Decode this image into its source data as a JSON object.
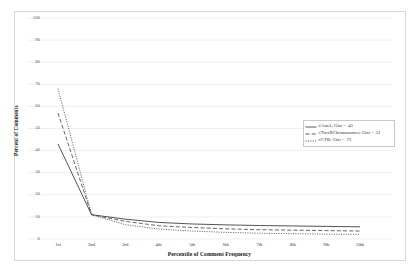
{
  "chart_data": {
    "type": "line",
    "title": "",
    "xlabel": "Percentile of Comment Frequency",
    "ylabel": "Percent of Comments",
    "categories": [
      "1st",
      "2nd",
      "3rd",
      "4th",
      "5th",
      "6th",
      "7th",
      "8th",
      "9th",
      "10th"
    ],
    "ylim": [
      0,
      100
    ],
    "yticks": [
      0,
      10,
      20,
      30,
      40,
      50,
      60,
      70,
      80,
      90,
      100
    ],
    "grid": true,
    "legend_position": "center-right",
    "series": [
      {
        "name": "r/AmA; Gini = .43",
        "label": "r/AmA; Gini = .43",
        "style": "solid",
        "color": "#4a4a4a",
        "values": [
          43,
          11,
          9,
          7.5,
          6.8,
          6.4,
          6.1,
          5.9,
          5.7,
          5.5
        ]
      },
      {
        "name": "r/TwoXChromosomes; Gini = .51",
        "label": "r/TwoXChromosomes; Gini = .51",
        "style": "dashed",
        "color": "#4a4a4a",
        "values": [
          57,
          11,
          8,
          6,
          5.2,
          4.6,
          4.2,
          4.0,
          3.8,
          3.6
        ]
      },
      {
        "name": "r/CFB; Gini = .73",
        "label": "r/CFB; Gini = .73",
        "style": "dotted",
        "color": "#4a4a4a",
        "values": [
          68,
          11,
          6.5,
          4.5,
          3.6,
          3.0,
          2.6,
          2.4,
          2.2,
          2.1
        ]
      }
    ]
  },
  "axes": {
    "ytick_labels": [
      "100",
      "90",
      "80",
      "70",
      "60",
      "50",
      "40",
      "30",
      "20",
      "10",
      "0"
    ],
    "xtick_labels": [
      "1st",
      "2nd",
      "3rd",
      "4th",
      "5th",
      "6th",
      "7th",
      "8th",
      "9th",
      "10th"
    ],
    "y_axis_title": "Percent of Comments",
    "x_axis_title": "Percentile of Comment Frequency"
  },
  "legend": {
    "entries": [
      "r/AmA; Gini = .43",
      "r/TwoXChromosomes; Gini = .51",
      "r/CFB; Gini = .73"
    ]
  },
  "colors": {
    "line": "#4a4a4a",
    "grid": "#e4e4e4",
    "frame": "#d8d8d8",
    "tick_text": "#5a5a5a",
    "axis_title": "#111111"
  }
}
